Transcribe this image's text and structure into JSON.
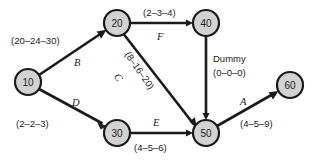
{
  "diagram": {
    "colors": {
      "node_fill": "#d2d2d2",
      "node_stroke": "#1a1a1a",
      "edge": "#1a1a1a",
      "background": "#ffffff"
    },
    "nodes": [
      {
        "id": "10",
        "label": "10",
        "cx": 28,
        "cy": 82,
        "r": 13
      },
      {
        "id": "20",
        "label": "20",
        "cx": 117,
        "cy": 23,
        "r": 13
      },
      {
        "id": "30",
        "label": "30",
        "cx": 117,
        "cy": 133,
        "r": 13
      },
      {
        "id": "40",
        "label": "40",
        "cx": 206,
        "cy": 23,
        "r": 13
      },
      {
        "id": "50",
        "label": "50",
        "cx": 206,
        "cy": 133,
        "r": 13
      },
      {
        "id": "60",
        "label": "60",
        "cx": 290,
        "cy": 85,
        "r": 13
      }
    ],
    "edges": [
      {
        "activity": "B",
        "from": "10",
        "to": "20",
        "duration": "(20–24–30)"
      },
      {
        "activity": "D",
        "from": "10",
        "to": "30",
        "duration": "(2–2–3)"
      },
      {
        "activity": "F",
        "from": "20",
        "to": "40",
        "duration": "(2–3–4)"
      },
      {
        "activity": "C",
        "from": "20",
        "to": "50",
        "duration": "(8–16–20)"
      },
      {
        "activity": "E",
        "from": "30",
        "to": "50",
        "duration": "(4–5–6)"
      },
      {
        "activity": "Dummy",
        "from": "40",
        "to": "50",
        "duration": "(0–0–0)"
      },
      {
        "activity": "A",
        "from": "50",
        "to": "60",
        "duration": "(4–5–9)"
      }
    ],
    "labels": {
      "b_activity": "B",
      "b_duration": "(20–24–30)",
      "d_activity": "D",
      "d_duration": "(2–2–3)",
      "f_activity": "F",
      "f_duration": "(2–3–4)",
      "c_activity": "C",
      "c_duration": "(8–16–20)",
      "e_activity": "E",
      "e_duration": "(4–5–6)",
      "dummy_word": "Dummy",
      "dummy_duration": "(0–0–0)",
      "a_activity": "A",
      "a_duration": "(4–5–9)"
    },
    "node_labels": {
      "n10": "10",
      "n20": "20",
      "n30": "30",
      "n40": "40",
      "n50": "50",
      "n60": "60"
    }
  }
}
